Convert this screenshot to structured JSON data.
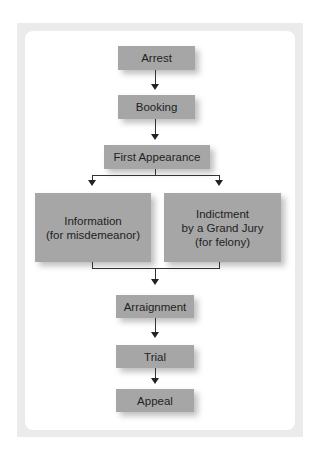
{
  "diagram": {
    "type": "flowchart",
    "nodes": {
      "arrest": "Arrest",
      "booking": "Booking",
      "first_appearance": "First Appearance",
      "information": "Information\n(for misdemeanor)",
      "indictment": "Indictment\nby a Grand Jury\n(for felony)",
      "arraignment": "Arraignment",
      "trial": "Trial",
      "appeal": "Appeal"
    },
    "edges": [
      [
        "arrest",
        "booking"
      ],
      [
        "booking",
        "first_appearance"
      ],
      [
        "first_appearance",
        "information"
      ],
      [
        "first_appearance",
        "indictment"
      ],
      [
        "information",
        "arraignment"
      ],
      [
        "indictment",
        "arraignment"
      ],
      [
        "arraignment",
        "trial"
      ],
      [
        "trial",
        "appeal"
      ]
    ],
    "colors": {
      "box_fill": "#a6a6a6",
      "frame": "#ebebeb",
      "connector": "#333333"
    }
  }
}
